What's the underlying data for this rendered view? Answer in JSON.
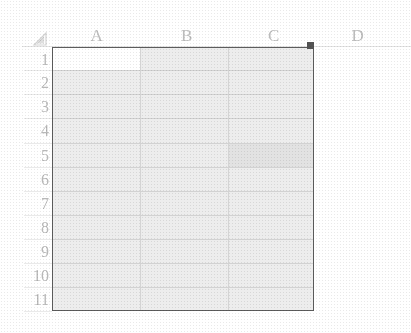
{
  "app": {
    "type": "spreadsheet",
    "select_all_icon": "select-all-triangle-icon"
  },
  "grid": {
    "columns": [
      {
        "label": "A",
        "left": 52,
        "width": 88,
        "center": 97
      },
      {
        "label": "B",
        "left": 140,
        "width": 88,
        "center": 187
      },
      {
        "label": "C",
        "left": 228,
        "width": 86,
        "center": 274
      },
      {
        "label": "D",
        "left": 314,
        "width": 88,
        "center": 358
      }
    ],
    "rows": [
      {
        "label": "1",
        "top": 47,
        "height": 23
      },
      {
        "label": "2",
        "top": 70,
        "height": 24
      },
      {
        "label": "3",
        "top": 94,
        "height": 24
      },
      {
        "label": "4",
        "top": 118,
        "height": 25
      },
      {
        "label": "5",
        "top": 143,
        "height": 24
      },
      {
        "label": "6",
        "top": 167,
        "height": 24
      },
      {
        "label": "7",
        "top": 191,
        "height": 24
      },
      {
        "label": "8",
        "top": 215,
        "height": 24
      },
      {
        "label": "9",
        "top": 239,
        "height": 24
      },
      {
        "label": "10",
        "top": 263,
        "height": 24
      },
      {
        "label": "11",
        "top": 287,
        "height": 24
      }
    ],
    "cells": [],
    "selection": {
      "range": "A1:C11",
      "active_cell": "A1",
      "active_cell_value": "",
      "fill_handle": "fill-handle",
      "border_color": "#565656",
      "fill_color": "#ebebeb",
      "active_cell_color": "#ffffff"
    },
    "colors": {
      "background": "#ffffff",
      "header_text": "#b9b9b9",
      "gridline": "#d2d2d2",
      "header_rule": "#e2e2e2"
    }
  }
}
